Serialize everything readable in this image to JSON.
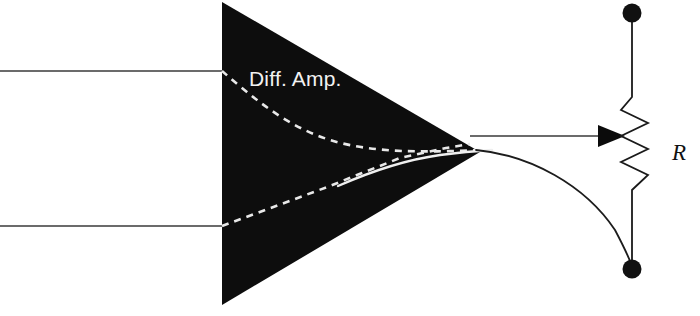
{
  "figure": {
    "background_color": "#ffffff",
    "width": 700,
    "height": 316
  },
  "amplifier": {
    "label": "Diff. Amp.",
    "label_color": "#f2f2f2",
    "body_color": "#0d0d0d",
    "shape": "triangle",
    "apex": {
      "x": 480,
      "y": 152
    },
    "left_top": {
      "x": 222,
      "y": 2
    },
    "left_bottom": {
      "x": 222,
      "y": 305
    },
    "internal_traces": [
      {
        "name": "upper-dashed-trace",
        "style": "dashed",
        "color": "#e8e8e8"
      },
      {
        "name": "lower-dashed-trace",
        "style": "dashed",
        "color": "#e8e8e8"
      },
      {
        "name": "solid-output-trace",
        "style": "solid",
        "color": "#efefef"
      }
    ]
  },
  "inputs": [
    {
      "name": "non-inverting-input",
      "y": 71,
      "x_start": 0,
      "x_end": 222
    },
    {
      "name": "inverting-input",
      "y": 226,
      "x_start": 0,
      "x_end": 222
    }
  ],
  "outputs": [
    {
      "name": "wiper-output-wire",
      "from_x": 480,
      "from_y": 136,
      "to_x": 625,
      "to_y": 136,
      "has_arrow": true
    },
    {
      "name": "return-curve-wire",
      "from_x": 480,
      "from_y": 152,
      "to_x": 632,
      "to_y": 268
    }
  ],
  "resistor": {
    "label": "R",
    "label_color": "#111111",
    "label_x": 672,
    "label_y": 152,
    "orientation": "vertical",
    "center_x": 632,
    "zigzag_left_x": 621,
    "zigzag_right_x": 648,
    "zigzag_top_y": 97,
    "zigzag_bottom_y": 190,
    "stroke_color": "#1a1a1a",
    "terminals": [
      {
        "name": "top-terminal",
        "x": 632,
        "y": 13,
        "radius": 9,
        "color": "#111111"
      },
      {
        "name": "bottom-terminal",
        "x": 632,
        "y": 269,
        "radius": 9,
        "color": "#111111"
      }
    ]
  },
  "arrow": {
    "name": "wiper-arrow",
    "tip_x": 625,
    "tip_y": 136,
    "color": "#0b0b0b"
  }
}
